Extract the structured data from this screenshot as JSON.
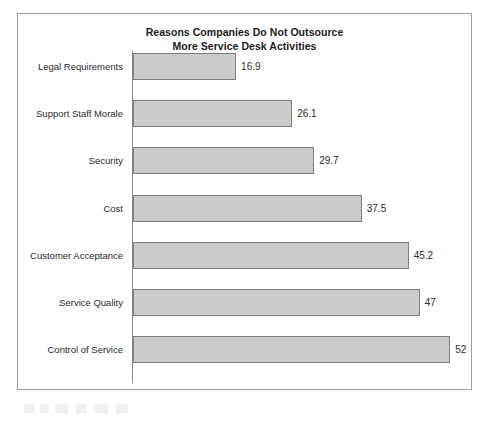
{
  "chart_data": {
    "type": "bar",
    "orientation": "horizontal",
    "title": "Reasons Companies Do Not Outsource\nMore Service Desk Activities",
    "xlabel": "",
    "ylabel": "",
    "xlim": [
      0,
      55
    ],
    "grid": false,
    "legend": false,
    "value_labels": true,
    "categories": [
      "Legal Requirements",
      "Support Staff Morale",
      "Security",
      "Cost",
      "Customer Acceptance",
      "Service Quality",
      "Control of Service"
    ],
    "values": [
      16.9,
      26.1,
      29.7,
      37.5,
      45.2,
      47,
      52
    ],
    "value_label_text": [
      "16.9",
      "26.1",
      "29.7",
      "37.5",
      "45.2",
      "47",
      "52"
    ],
    "bars": [
      {
        "category": "Legal Requirements",
        "value": 16.9,
        "label": "16.9"
      },
      {
        "category": "Support Staff Morale",
        "value": 26.1,
        "label": "26.1"
      },
      {
        "category": "Security",
        "value": 29.7,
        "label": "29.7"
      },
      {
        "category": "Cost",
        "value": 37.5,
        "label": "37.5"
      },
      {
        "category": "Customer Acceptance",
        "value": 45.2,
        "label": "45.2"
      },
      {
        "category": "Service Quality",
        "value": 47,
        "label": "47"
      },
      {
        "category": "Control of Service",
        "value": 52,
        "label": "52"
      }
    ],
    "colors": {
      "bar_fill": "#cbcbcb",
      "bar_border": "#7d7d7d",
      "axis_line": "#8a8a8a",
      "frame_border": "#9c9c9c",
      "text": "#2a2a2a",
      "title_text": "#1b1b1b",
      "background": "#ffffff"
    }
  }
}
